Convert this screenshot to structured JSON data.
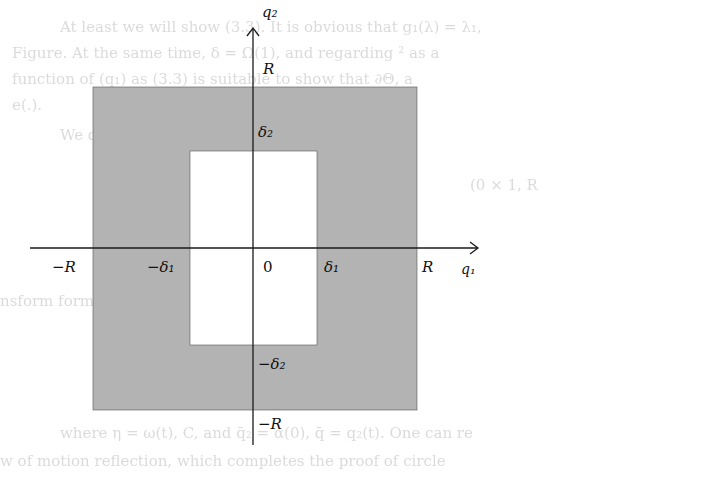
{
  "background_text": [
    {
      "text": "At least we will show (3.3). It is obvious that g₁(λ) = λ₁,",
      "x": 60,
      "y": 18
    },
    {
      "text": "Figure. At the same time, δ = Ω(1), and regarding ² as a",
      "x": 12,
      "y": 44
    },
    {
      "text": "function of (q₁) as (3.3) is suitable to show that ∂Θ, a",
      "x": 12,
      "y": 70
    },
    {
      "text": "e(.).",
      "x": 12,
      "y": 96
    },
    {
      "text": "We define",
      "x": 60,
      "y": 126
    },
    {
      "text": "(0 × 1, R",
      "x": 470,
      "y": 176
    },
    {
      "text": "nsform formula",
      "x": 0,
      "y": 292
    },
    {
      "text": "ρ(c, λ) ... ∫(λ₁ ... q₁ ... (λ − λ)∫q₂)",
      "x": 120,
      "y": 355
    },
    {
      "text": "where η = ω(t), C, and q̄₂ = α(0), q̄ = q₂(t). One can re",
      "x": 60,
      "y": 424
    },
    {
      "text": "w of motion reflection, which completes the proof of circle",
      "x": 0,
      "y": 452
    }
  ],
  "diagram": {
    "colors": {
      "shaded": "#b3b3b3",
      "axis": "#1a1a1a",
      "hole": "#ffffff"
    },
    "outer_square": {
      "x": 93,
      "y": 87,
      "w": 324,
      "h": 323
    },
    "inner_hole": {
      "x": 190,
      "y": 151,
      "w": 127,
      "h": 194
    },
    "x_axis": {
      "x1": 30,
      "x2": 478,
      "y": 248
    },
    "y_axis": {
      "x": 253,
      "y1": 410,
      "y2": 28,
      "bottom": 445
    },
    "labels": {
      "q2": "q₂",
      "q1": "q₁",
      "R_top": "R",
      "delta2": "δ₂",
      "neg_R_left": "−R",
      "neg_delta1": "−δ₁",
      "origin": "0",
      "delta1": "δ₁",
      "R_right": "R",
      "neg_delta2": "−δ₂",
      "neg_R_bottom": "−R"
    }
  }
}
